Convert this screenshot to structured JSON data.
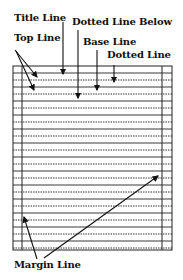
{
  "labels": {
    "title_line": "Title Line",
    "dotted_line_below": "Dotted Line Below",
    "top_line": "Top Line",
    "base_line": "Base Line",
    "dotted_line": "Dotted Line",
    "margin_line": "Margin Line"
  },
  "paper": {
    "left": 13,
    "right": 172,
    "top": 66,
    "bottom": 250,
    "left_margin_x": 22,
    "right_margin_x": 162,
    "line_spacing": 7,
    "pattern": "alternating solid and dotted lines",
    "line_color": "#222222"
  }
}
